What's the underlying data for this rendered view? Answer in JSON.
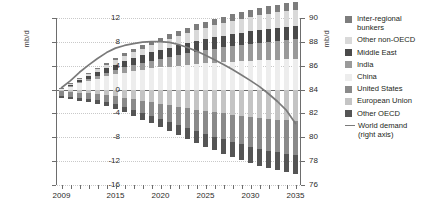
{
  "axes": {
    "left_title": "mb/d",
    "right_title": "mb/d",
    "left_ticks": [
      "12",
      "8",
      "4",
      "0",
      "-4",
      "-8",
      "-12",
      "-16"
    ],
    "right_ticks": [
      "90",
      "88",
      "86",
      "84",
      "82",
      "80",
      "78",
      "76"
    ],
    "x_ticks": [
      "2009",
      "2015",
      "2020",
      "2025",
      "2030",
      "2035"
    ]
  },
  "legend": {
    "items": [
      {
        "label": "Inter-regional bunkers",
        "color": "#7d7d7d",
        "type": "swatch"
      },
      {
        "label": "Other non-OECD",
        "color": "#d9d9d9",
        "type": "swatch"
      },
      {
        "label": "Middle East",
        "color": "#4a4a4a",
        "type": "swatch"
      },
      {
        "label": "India",
        "color": "#9a9a9a",
        "type": "swatch"
      },
      {
        "label": "China",
        "color": "#ededed",
        "type": "swatch"
      },
      {
        "label": "United States",
        "color": "#8a8a8a",
        "type": "swatch"
      },
      {
        "label": "European Union",
        "color": "#c4c4c4",
        "type": "swatch"
      },
      {
        "label": "Other OECD",
        "color": "#555555",
        "type": "swatch"
      },
      {
        "label": "World demand",
        "sublabel": "(right axis)",
        "color": "#7a7a7a",
        "type": "line"
      }
    ]
  },
  "chart_data": {
    "type": "bar",
    "title": "",
    "xlabel": "",
    "ylabel": "mb/d",
    "y2label": "mb/d",
    "ylim": [
      -16,
      12
    ],
    "y2lim": [
      76,
      90
    ],
    "grid": true,
    "legend_position": "right",
    "stacked": true,
    "x": [
      2009,
      2010,
      2011,
      2012,
      2013,
      2014,
      2015,
      2016,
      2017,
      2018,
      2019,
      2020,
      2021,
      2022,
      2023,
      2024,
      2025,
      2026,
      2027,
      2028,
      2029,
      2030,
      2031,
      2032,
      2033,
      2034,
      2035
    ],
    "categories": [
      "2009",
      "2010",
      "2011",
      "2012",
      "2013",
      "2014",
      "2015",
      "2016",
      "2017",
      "2018",
      "2019",
      "2020",
      "2021",
      "2022",
      "2023",
      "2024",
      "2025",
      "2026",
      "2027",
      "2028",
      "2029",
      "2030",
      "2031",
      "2032",
      "2033",
      "2034",
      "2035"
    ],
    "series": [
      {
        "name": "China",
        "color": "#ededed",
        "sign": "positive",
        "values": [
          0.15,
          0.55,
          1.05,
          1.45,
          1.85,
          2.25,
          2.55,
          2.85,
          3.1,
          3.35,
          3.55,
          3.7,
          3.85,
          4.0,
          4.15,
          4.3,
          4.4,
          4.5,
          4.6,
          4.7,
          4.78,
          4.85,
          4.92,
          4.98,
          5.04,
          5.1,
          5.15
        ]
      },
      {
        "name": "India",
        "color": "#9a9a9a",
        "sign": "positive",
        "values": [
          0.05,
          0.12,
          0.22,
          0.32,
          0.45,
          0.58,
          0.72,
          0.86,
          1.0,
          1.15,
          1.3,
          1.45,
          1.6,
          1.75,
          1.9,
          2.05,
          2.2,
          2.35,
          2.48,
          2.6,
          2.72,
          2.84,
          2.95,
          3.05,
          3.15,
          3.25,
          3.35
        ]
      },
      {
        "name": "Middle East",
        "color": "#4a4a4a",
        "sign": "positive",
        "values": [
          0.05,
          0.18,
          0.32,
          0.48,
          0.62,
          0.78,
          0.92,
          1.05,
          1.18,
          1.3,
          1.4,
          1.5,
          1.58,
          1.66,
          1.74,
          1.8,
          1.86,
          1.92,
          1.96,
          2.0,
          2.04,
          2.08,
          2.12,
          2.15,
          2.18,
          2.2,
          2.22
        ]
      },
      {
        "name": "Other non-OECD",
        "color": "#d9d9d9",
        "sign": "positive",
        "values": [
          0.04,
          0.12,
          0.22,
          0.33,
          0.45,
          0.58,
          0.7,
          0.83,
          0.95,
          1.08,
          1.2,
          1.32,
          1.44,
          1.56,
          1.68,
          1.8,
          1.9,
          2.0,
          2.1,
          2.2,
          2.28,
          2.36,
          2.44,
          2.52,
          2.58,
          2.64,
          2.7
        ]
      },
      {
        "name": "Inter-regional bunkers",
        "color": "#7d7d7d",
        "sign": "positive",
        "values": [
          0.02,
          0.06,
          0.12,
          0.18,
          0.25,
          0.32,
          0.4,
          0.48,
          0.55,
          0.62,
          0.68,
          0.74,
          0.8,
          0.86,
          0.92,
          0.97,
          1.02,
          1.06,
          1.1,
          1.14,
          1.17,
          1.2,
          1.23,
          1.26,
          1.28,
          1.3,
          1.32
        ]
      },
      {
        "name": "European Union",
        "color": "#c4c4c4",
        "sign": "negative",
        "values": [
          -0.3,
          -0.4,
          -0.5,
          -0.62,
          -0.78,
          -0.95,
          -1.15,
          -1.38,
          -1.62,
          -1.88,
          -2.12,
          -2.38,
          -2.62,
          -2.88,
          -3.12,
          -3.35,
          -3.58,
          -3.8,
          -4.0,
          -4.2,
          -4.4,
          -4.58,
          -4.75,
          -4.9,
          -5.05,
          -5.18,
          -5.3
        ]
      },
      {
        "name": "United States",
        "color": "#8a8a8a",
        "sign": "negative",
        "values": [
          -0.7,
          -0.8,
          -0.85,
          -0.9,
          -0.98,
          -1.1,
          -1.28,
          -1.5,
          -1.75,
          -2.0,
          -2.25,
          -2.52,
          -2.8,
          -3.08,
          -3.35,
          -3.62,
          -3.88,
          -4.12,
          -4.35,
          -4.58,
          -4.78,
          -4.98,
          -5.15,
          -5.32,
          -5.48,
          -5.62,
          -5.75
        ]
      },
      {
        "name": "Other OECD",
        "color": "#555555",
        "sign": "negative",
        "values": [
          -0.4,
          -0.45,
          -0.5,
          -0.55,
          -0.62,
          -0.7,
          -0.8,
          -0.92,
          -1.05,
          -1.18,
          -1.32,
          -1.46,
          -1.6,
          -1.74,
          -1.88,
          -2.02,
          -2.15,
          -2.28,
          -2.4,
          -2.52,
          -2.64,
          -2.75,
          -2.85,
          -2.94,
          -3.02,
          -3.1,
          -3.18
        ]
      }
    ],
    "line_series": {
      "name": "World demand",
      "axis": "right",
      "color": "#7a7a7a",
      "values_left_axis": [
        0.3,
        1.5,
        2.9,
        4.1,
        5.2,
        6.2,
        6.95,
        7.4,
        7.7,
        7.95,
        8.05,
        8.05,
        7.9,
        7.55,
        7.05,
        6.45,
        5.75,
        5.0,
        4.2,
        3.35,
        2.45,
        1.5,
        0.5,
        -0.7,
        -2.0,
        -3.5,
        -5.7
      ],
      "values_right_axis": [
        84.15,
        84.75,
        85.45,
        86.05,
        86.6,
        87.1,
        87.48,
        87.7,
        87.85,
        87.98,
        88.03,
        88.03,
        87.95,
        87.78,
        87.53,
        87.23,
        86.88,
        86.5,
        86.1,
        85.68,
        85.23,
        84.75,
        84.25,
        83.65,
        83.0,
        82.25,
        81.15
      ]
    }
  }
}
